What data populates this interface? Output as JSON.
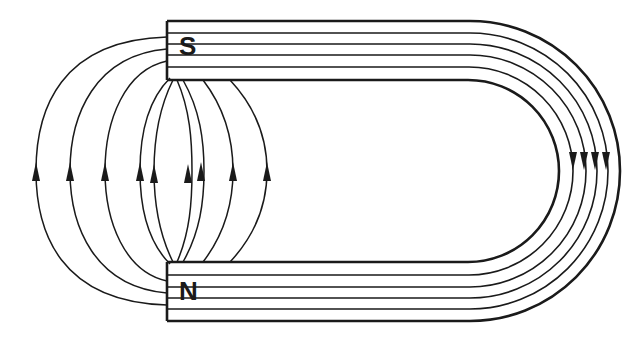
{
  "diagram": {
    "poles": {
      "south": {
        "label": "S"
      },
      "north": {
        "label": "N"
      }
    },
    "internal_flux_lines": 4,
    "external_field_lines": 9,
    "colors": {
      "ink": "#1a1a1a",
      "background": "#ffffff"
    }
  }
}
